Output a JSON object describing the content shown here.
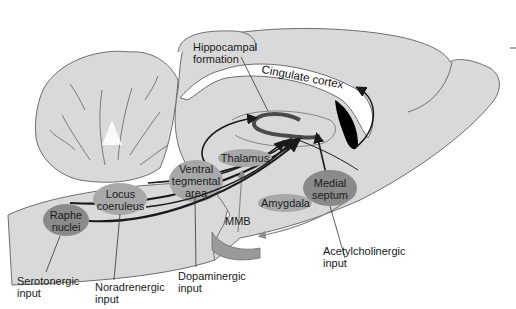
{
  "diagram": {
    "type": "sagittal brain section with neurotransmitter input pathways",
    "colors": {
      "tissue": "#d9d9d9",
      "outline": "#6e6e6e",
      "nucleus_light": "#a8a8a8",
      "nucleus_dark": "#8a8a8a",
      "pathway": "#1a1a1a",
      "gray_pathway": "#8c8c8c",
      "white_matter": "#ffffff",
      "ventricle": "#000000"
    },
    "structures": {
      "hippocampal": "Hippocampal\nformation",
      "cingulate": "Cingulate cortex",
      "thalamus": "Thalamus",
      "vta": "Ventral\ntegmental\narea",
      "locus": "Locus\ncoeruleus",
      "raphe": "Raphe\nnuclei",
      "medial_septum": "Medial\nseptum",
      "amygdala": "Amygdala",
      "mmb": "MMB"
    },
    "inputs": {
      "serotonergic": "Serotonergic\ninput",
      "noradrenergic": "Noradrenergic\ninput",
      "dopaminergic": "Dopaminergic\ninput",
      "acetylcholinergic": "Acetylcholinergic\ninput"
    }
  }
}
